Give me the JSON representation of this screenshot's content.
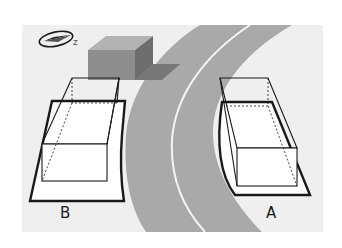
{
  "diagram": {
    "compass": {
      "icon": "compass-north-arrow-icon",
      "letter": "z"
    },
    "building": {
      "icon": "building-block-icon"
    },
    "road": {
      "icon": "curved-road-icon",
      "lane_divider": true
    },
    "spaces": [
      {
        "id": "B",
        "label": "B",
        "position": "left"
      },
      {
        "id": "A",
        "label": "A",
        "position": "right"
      }
    ]
  },
  "colors": {
    "panel": "#efefef",
    "road": "#a9a9a9",
    "lane_stripe": "#f4f4f4",
    "building_front": "#8e8e8e",
    "building_side": "#6d6d6d",
    "building_shadow": "#7a7a7a",
    "outline": "#1a1a1a"
  }
}
